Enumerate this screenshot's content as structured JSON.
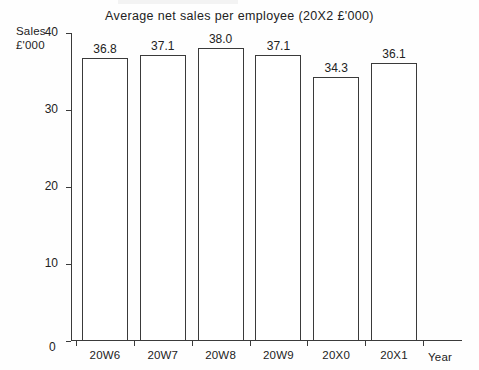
{
  "chart_data": {
    "type": "bar",
    "title": "Average net sales per employee (20X2 £'000)",
    "categories": [
      "20W6",
      "20W7",
      "20W8",
      "20W9",
      "20X0",
      "20X1"
    ],
    "values": [
      36.8,
      37.1,
      38.0,
      37.1,
      34.3,
      36.1
    ],
    "value_labels": [
      "36.8",
      "37.1",
      "38.0",
      "37.1",
      "34.3",
      "36.1"
    ],
    "xlabel": "Year",
    "ylabel": "Sales £'000",
    "ylabel_lines": [
      "Sales",
      "£'000"
    ],
    "ylim": [
      0,
      40
    ],
    "yticks": [
      0,
      10,
      20,
      30,
      40
    ],
    "ytick_labels": [
      "0",
      "10",
      "20",
      "30",
      "40"
    ],
    "grid": false,
    "legend": null,
    "bar_fill_color": "#ffffff",
    "bar_border_color": "#3a3a3a",
    "axis_color": "#3a3a3a",
    "text_color": "#222222",
    "background_color": "#fefefe"
  }
}
